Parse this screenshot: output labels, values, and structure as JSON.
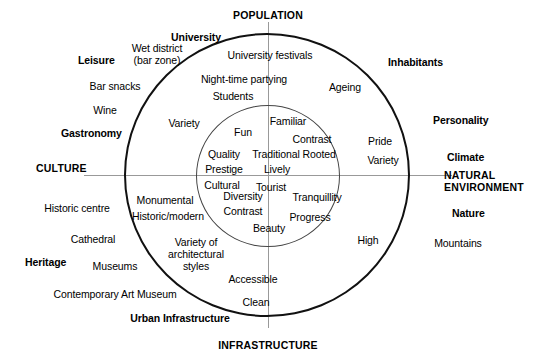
{
  "diagram": {
    "type": "concentric-circle-quadrant-diagram",
    "geometry": {
      "center_x": 268,
      "center_y": 175,
      "outer_radius": 143,
      "inner_radius": 72
    }
  },
  "axis_headings": {
    "top": "POPULATION",
    "bottom": "INFRASTRUCTURE",
    "left": "CULTURE",
    "right_line1": "NATURAL",
    "right_line2": "ENVIRONMENT"
  },
  "category_headings": [
    {
      "label": "University",
      "quadrant": "top-left"
    },
    {
      "label": "Leisure",
      "quadrant": "left-upper"
    },
    {
      "label": "Gastronomy",
      "quadrant": "left-upper"
    },
    {
      "label": "Inhabitants",
      "quadrant": "top-right"
    },
    {
      "label": "Personality",
      "quadrant": "right-upper"
    },
    {
      "label": "Climate",
      "quadrant": "right-upper"
    },
    {
      "label": "Heritage",
      "quadrant": "left-lower"
    },
    {
      "label": "Nature",
      "quadrant": "right-lower"
    },
    {
      "label": "Urban Infrastructure",
      "quadrant": "bottom"
    }
  ],
  "outside_items": [
    {
      "label": "Wet district",
      "sub": "(bar zone)"
    },
    {
      "label": "Bar snacks"
    },
    {
      "label": "Wine"
    },
    {
      "label": "Historic centre"
    },
    {
      "label": "Cathedral"
    },
    {
      "label": "Museums"
    },
    {
      "label": "Contemporary Art Museum"
    },
    {
      "label": "Mountains"
    }
  ],
  "middle_ring_items": [
    {
      "label": "University festivals"
    },
    {
      "label": "Night-time partying"
    },
    {
      "label": "Students"
    },
    {
      "label": "Variety"
    },
    {
      "label": "Ageing"
    },
    {
      "label": "Pride"
    },
    {
      "label": "Variety"
    },
    {
      "label": "Monumental"
    },
    {
      "label": "Historic/modern"
    },
    {
      "label": "Variety of architectural styles"
    },
    {
      "label": "Accessible"
    },
    {
      "label": "Clean"
    },
    {
      "label": "High"
    }
  ],
  "inner_core_items": [
    {
      "label": "Familiar"
    },
    {
      "label": "Fun"
    },
    {
      "label": "Contrast"
    },
    {
      "label": "Quality"
    },
    {
      "label": "Traditional Rooted"
    },
    {
      "label": "Prestige"
    },
    {
      "label": "Lively"
    },
    {
      "label": "Cultural"
    },
    {
      "label": "Tourist"
    },
    {
      "label": "Diversity"
    },
    {
      "label": "Tranquillity"
    },
    {
      "label": "Contrast"
    },
    {
      "label": "Progress"
    },
    {
      "label": "Beauty"
    }
  ],
  "text": {
    "population": "POPULATION",
    "infrastructure": "INFRASTRUCTURE",
    "culture": "CULTURE",
    "natural_line1": "NATURAL",
    "natural_line2": "ENVIRONMENT",
    "university": "University",
    "leisure": "Leisure",
    "gastronomy": "Gastronomy",
    "inhabitants": "Inhabitants",
    "personality": "Personality",
    "climate": "Climate",
    "heritage": "Heritage",
    "nature": "Nature",
    "urban_infrastructure": "Urban Infrastructure",
    "wet_district_l1": "Wet district",
    "wet_district_l2": "(bar zone)",
    "bar_snacks": "Bar snacks",
    "wine": "Wine",
    "historic_centre": "Historic centre",
    "cathedral": "Cathedral",
    "museums": "Museums",
    "contemporary_art_museum": "Contemporary Art Museum",
    "mountains": "Mountains",
    "university_festivals": "University festivals",
    "night_time_partying": "Night-time partying",
    "students": "Students",
    "variety_left": "Variety",
    "ageing": "Ageing",
    "pride": "Pride",
    "variety_right": "Variety",
    "monumental": "Monumental",
    "historic_modern": "Historic/modern",
    "variety_arch_l1": "Variety of",
    "variety_arch_l2": "architectural",
    "variety_arch_l3": "styles",
    "accessible": "Accessible",
    "clean": "Clean",
    "high": "High",
    "familiar": "Familiar",
    "fun": "Fun",
    "contrast_top": "Contrast",
    "quality": "Quality",
    "traditional_rooted": "Traditional Rooted",
    "prestige": "Prestige",
    "lively": "Lively",
    "cultural": "Cultural",
    "tourist": "Tourist",
    "diversity": "Diversity",
    "tranquillity": "Tranquillity",
    "contrast_bottom": "Contrast",
    "progress": "Progress",
    "beauty": "Beauty"
  },
  "colors": {
    "background": "#ffffff",
    "foreground": "#000000",
    "outer_circle_stroke": "#111111",
    "inner_circle_stroke": "#444444",
    "axis_stroke": "#999999"
  }
}
